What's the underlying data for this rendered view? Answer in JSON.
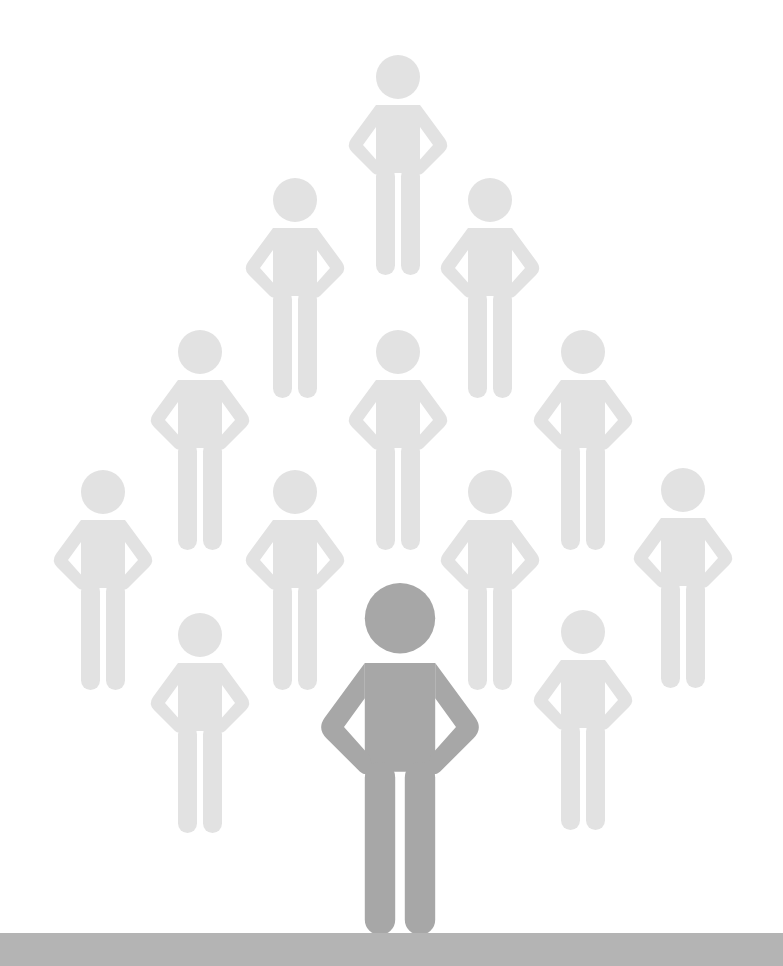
{
  "scene": {
    "description": "Illustration: pyramid of light gray stick figures standing behind one dark gray figure on a ground bar",
    "colors": {
      "background": "#ffffff",
      "crowd_figure": "#e2e2e2",
      "leader_figure": "#a7a7a7",
      "ground": "#b4b4b4"
    },
    "crowd": [
      {
        "cx": 398,
        "top": 55
      },
      {
        "cx": 295,
        "top": 178
      },
      {
        "cx": 490,
        "top": 178
      },
      {
        "cx": 200,
        "top": 330
      },
      {
        "cx": 398,
        "top": 330
      },
      {
        "cx": 583,
        "top": 330
      },
      {
        "cx": 103,
        "top": 470
      },
      {
        "cx": 295,
        "top": 470
      },
      {
        "cx": 490,
        "top": 470
      },
      {
        "cx": 683,
        "top": 468
      },
      {
        "cx": 200,
        "top": 613
      },
      {
        "cx": 583,
        "top": 610
      }
    ],
    "crowd_scale": 1.0,
    "leader": {
      "cx": 400,
      "top": 583,
      "scale": 1.6
    },
    "ground": {
      "top": 933,
      "height": 33
    }
  }
}
